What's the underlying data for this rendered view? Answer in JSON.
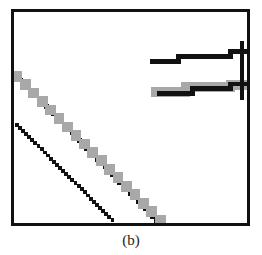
{
  "figure": {
    "caption": "(b)",
    "panel_label": "(b)",
    "background_color": "#ffffff",
    "frame_color": "#111111",
    "frame_border_px": 3,
    "frame_rect": {
      "x": 11,
      "y": 9,
      "width": 239,
      "height": 217
    }
  },
  "chart_data": {
    "type": "line",
    "title": "",
    "subtitle": "",
    "xlabel": "",
    "ylabel": "",
    "xlim": [
      0,
      239
    ],
    "ylim": [
      217,
      0
    ],
    "grid": false,
    "legend_position": "none",
    "axis_ticks_visible": false,
    "tick_labels": {
      "x": [],
      "y": []
    },
    "annotations": [],
    "colors": {
      "black": "#111111",
      "gray": "#a8a8a8",
      "light_gray": "#cfcfcf"
    },
    "series": [
      {
        "name": "upper-diagonal-black",
        "style": "staircase-diagonal",
        "color": "#111111",
        "line_width": 5,
        "points": [
          [
            3,
            66
          ],
          [
            146,
            214
          ]
        ]
      },
      {
        "name": "upper-diagonal-gray-shadow",
        "style": "staircase-diagonal",
        "color": "#a8a8a8",
        "line_width": 11,
        "points": [
          [
            3,
            66
          ],
          [
            150,
            214
          ]
        ]
      },
      {
        "name": "lower-diagonal-black",
        "style": "staircase-diagonal",
        "color": "#111111",
        "line_width": 4,
        "points": [
          [
            3,
            116
          ],
          [
            101,
            214
          ]
        ]
      },
      {
        "name": "upper-step-black",
        "style": "staircase-horizontal",
        "color": "#111111",
        "line_width": 5,
        "steps": [
          {
            "x_start": 139,
            "x_end": 170,
            "y": 51
          },
          {
            "x_start": 169,
            "x_end": 223,
            "y": 46
          },
          {
            "x_start": 222,
            "x_end": 239,
            "y": 41
          }
        ]
      },
      {
        "name": "lower-step-gray",
        "style": "staircase-horizontal",
        "color": "#a8a8a8",
        "line_width": 10,
        "steps": [
          {
            "x_start": 141,
            "x_end": 176,
            "y": 82
          },
          {
            "x_start": 176,
            "x_end": 222,
            "y": 77
          },
          {
            "x_start": 222,
            "x_end": 239,
            "y": 75
          }
        ]
      },
      {
        "name": "lower-step-black",
        "style": "staircase-horizontal",
        "color": "#111111",
        "line_width": 5,
        "steps": [
          {
            "x_start": 147,
            "x_end": 184,
            "y": 84
          },
          {
            "x_start": 183,
            "x_end": 222,
            "y": 79
          },
          {
            "x_start": 222,
            "x_end": 239,
            "y": 74
          }
        ]
      },
      {
        "name": "right-border-tick-vertical",
        "style": "vertical",
        "color": "#111111",
        "line_width": 4,
        "points": [
          [
            234,
            30
          ],
          [
            234,
            90
          ]
        ]
      }
    ]
  }
}
